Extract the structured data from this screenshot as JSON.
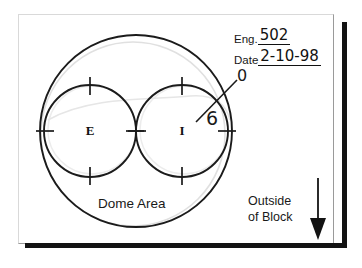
{
  "sheet": {
    "title": "Dome Area combustion chamber sketch",
    "background_color": "#ffffff",
    "frame_color": "#d9d9d9",
    "block_edge_color": "#131313"
  },
  "form": {
    "eng_label": "Eng.",
    "eng_value": "502",
    "date_label": "Date",
    "date_value": "2-10-98"
  },
  "callouts": {
    "zero": "0",
    "six": "6"
  },
  "annotations": {
    "dome_area": "Dome Area",
    "outside_line1": "Outside",
    "outside_line2": "of Block"
  },
  "ports": [
    {
      "id": "exhaust",
      "letter": "E",
      "cx": 90,
      "cy": 131,
      "r": 46
    },
    {
      "id": "intake",
      "letter": "I",
      "cx": 182,
      "cy": 131,
      "r": 46
    }
  ],
  "dome": {
    "cx": 136,
    "cy": 131,
    "r": 96,
    "stroke": "#1b1b1b",
    "ghost_stroke": "#dcdcdc"
  },
  "arrow": {
    "name": "down-arrow",
    "direction": "down",
    "x": 318,
    "y_top": 178,
    "y_bottom": 238,
    "color": "#131313"
  }
}
